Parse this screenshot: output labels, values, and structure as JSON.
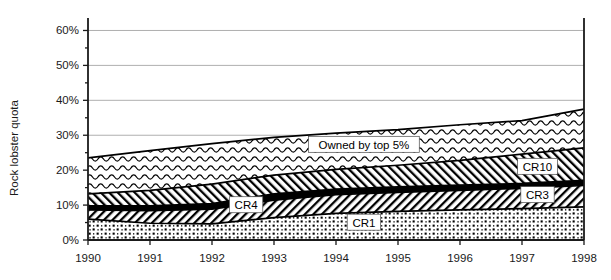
{
  "chart_data": {
    "type": "area",
    "title": "",
    "xlabel": "",
    "ylabel": "Rock lobster quota",
    "x": [
      1990,
      1991,
      1992,
      1993,
      1994,
      1995,
      1996,
      1997,
      1998
    ],
    "categories": [
      "1990",
      "1991",
      "1992",
      "1993",
      "1994",
      "1995",
      "1996",
      "1997",
      "1998"
    ],
    "xtick_labels": [
      "1990",
      "1991",
      "1992",
      "1993",
      "1994",
      "1995",
      "1996",
      "1997",
      "1998"
    ],
    "ytick_labels": [
      "0%",
      "10%",
      "20%",
      "30%",
      "40%",
      "50%",
      "60%"
    ],
    "ytick_values": [
      0,
      10,
      20,
      30,
      40,
      50,
      60
    ],
    "ylim": [
      0,
      63
    ],
    "xlim": [
      1990,
      1998
    ],
    "grid": true,
    "grid_axis": "y",
    "legend": "inline-labels",
    "stacked": true,
    "units": "percent",
    "series": [
      {
        "name": "CR1",
        "label": "CR1",
        "fill": "dotted",
        "cumulative_values": [
          6.0,
          4.8,
          4.6,
          6.4,
          7.6,
          8.2,
          8.6,
          9.0,
          9.5
        ],
        "values": [
          6.0,
          4.8,
          4.6,
          6.4,
          7.6,
          8.2,
          8.6,
          9.0,
          9.5
        ]
      },
      {
        "name": "CR3",
        "label": "CR3",
        "fill": "diagonal-hatch",
        "cumulative_values": [
          8.6,
          8.4,
          8.8,
          11.4,
          13.0,
          13.6,
          14.2,
          14.8,
          15.6
        ],
        "values": [
          2.6,
          3.6,
          4.2,
          5.0,
          5.4,
          5.4,
          5.6,
          5.8,
          6.1
        ]
      },
      {
        "name": "CR4",
        "label": "CR4",
        "fill": "solid-black",
        "cumulative_values": [
          9.8,
          9.8,
          10.4,
          13.2,
          14.6,
          15.2,
          15.7,
          16.2,
          17.1
        ],
        "values": [
          1.2,
          1.4,
          1.6,
          1.8,
          1.6,
          1.6,
          1.5,
          1.4,
          1.5
        ]
      },
      {
        "name": "CR10",
        "label": "CR10",
        "fill": "reverse-diagonal-hatch",
        "cumulative_values": [
          13.2,
          14.2,
          16.0,
          18.6,
          20.2,
          21.4,
          22.8,
          24.6,
          26.4
        ],
        "values": [
          3.4,
          4.4,
          5.6,
          5.4,
          5.6,
          6.2,
          7.1,
          8.4,
          9.3
        ]
      },
      {
        "name": "Owned by top 5%",
        "label": "Owned by top 5%",
        "fill": "wavy-zigzag",
        "cumulative_values": [
          23.5,
          25.6,
          27.6,
          29.4,
          30.6,
          31.6,
          33.0,
          34.2,
          37.5
        ],
        "values": [
          10.3,
          11.4,
          11.6,
          10.8,
          10.4,
          10.2,
          10.2,
          9.6,
          11.1
        ]
      }
    ],
    "inline_labels": [
      {
        "text": "Owned by top 5%",
        "series": "Owned by top 5%"
      },
      {
        "text": "CR10",
        "series": "CR10"
      },
      {
        "text": "CR4",
        "series": "CR4"
      },
      {
        "text": "CR3",
        "series": "CR3"
      },
      {
        "text": "CR1",
        "series": "CR1"
      }
    ]
  },
  "axes": {
    "y_title": "Rock lobster quota"
  }
}
